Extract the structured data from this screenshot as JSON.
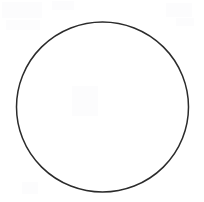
{
  "canvas": {
    "width": 204,
    "height": 202,
    "background_color": "#ffffff",
    "title": ""
  },
  "figure": {
    "kind": "circle-outline",
    "label": "",
    "stroke_color": "#2b2b2b",
    "stroke_width": 1.5,
    "fill_color": "none",
    "center_x": 102.5,
    "center_y": 107,
    "radius_x": 86,
    "radius_y": 85,
    "bounds": {
      "left": 16.5,
      "top": 22,
      "right": 188.5,
      "bottom": 192
    }
  },
  "annotations": [],
  "noise_specks": [
    {
      "x": 2,
      "y": 2,
      "w": 40,
      "h": 16
    },
    {
      "x": 6,
      "y": 20,
      "w": 34,
      "h": 10
    },
    {
      "x": 52,
      "y": 1,
      "w": 22,
      "h": 9
    },
    {
      "x": 166,
      "y": 3,
      "w": 26,
      "h": 14
    },
    {
      "x": 176,
      "y": 18,
      "w": 18,
      "h": 8
    },
    {
      "x": 72,
      "y": 86,
      "w": 26,
      "h": 30
    },
    {
      "x": 22,
      "y": 182,
      "w": 16,
      "h": 12
    }
  ]
}
